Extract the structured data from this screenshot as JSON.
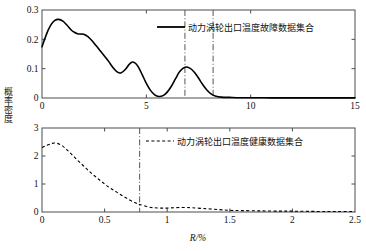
{
  "axis_label_y": "概率密度",
  "axis_label_x": "R/%",
  "colors": {
    "curve": "#000000",
    "axis": "#4d4d4d",
    "marker_line": "#555555",
    "background": "#ffffff"
  },
  "chart_data": [
    {
      "type": "line",
      "title": "",
      "xlabel": "",
      "ylabel": "概率密度",
      "xlim": [
        0,
        15
      ],
      "ylim": [
        0,
        0.3
      ],
      "xticks": [
        0,
        5,
        10,
        15
      ],
      "xticklabels": [
        "0",
        "5",
        "10",
        "15"
      ],
      "yticks": [
        0,
        0.1,
        0.2,
        0.3
      ],
      "yticklabels": [
        "0",
        "0.1",
        "0.2",
        "0.3"
      ],
      "grid": false,
      "legend_position": "top-center",
      "legend": [
        "动力涡轮出口温度故障数据集合"
      ],
      "linestyle": "solid",
      "vlines": [
        6.85,
        8.2
      ],
      "vline_style": "dashdot",
      "series": [
        {
          "name": "动力涡轮出口温度故障数据集合",
          "x": [
            0.0,
            0.15,
            0.3,
            0.45,
            0.6,
            0.8,
            1.0,
            1.2,
            1.4,
            1.55,
            1.7,
            1.85,
            2.0,
            2.2,
            2.4,
            2.6,
            2.8,
            3.0,
            3.2,
            3.4,
            3.6,
            3.8,
            4.0,
            4.15,
            4.3,
            4.45,
            4.6,
            4.8,
            5.0,
            5.2,
            5.4,
            5.6,
            5.8,
            6.0,
            6.2,
            6.4,
            6.6,
            6.85,
            7.1,
            7.3,
            7.5,
            7.7,
            7.9,
            8.1,
            8.3,
            8.6,
            9.0,
            9.5,
            10.0,
            11.0,
            12.0,
            13.0,
            14.0,
            15.0
          ],
          "y": [
            0.175,
            0.205,
            0.232,
            0.252,
            0.264,
            0.268,
            0.262,
            0.248,
            0.232,
            0.224,
            0.219,
            0.218,
            0.217,
            0.209,
            0.195,
            0.178,
            0.16,
            0.142,
            0.124,
            0.104,
            0.089,
            0.086,
            0.098,
            0.112,
            0.122,
            0.12,
            0.108,
            0.08,
            0.05,
            0.026,
            0.011,
            0.005,
            0.008,
            0.02,
            0.04,
            0.066,
            0.09,
            0.105,
            0.101,
            0.088,
            0.068,
            0.046,
            0.027,
            0.014,
            0.007,
            0.003,
            0.002,
            0.001,
            0.001,
            0.0005,
            0.0005,
            0.0005,
            0.0005,
            0.0005
          ]
        }
      ]
    },
    {
      "type": "line",
      "title": "",
      "xlabel": "R/%",
      "ylabel": "概率密度",
      "xlim": [
        0,
        2.5
      ],
      "ylim": [
        0,
        3
      ],
      "xticks": [
        0,
        0.5,
        1,
        1.5,
        2,
        2.5
      ],
      "xticklabels": [
        "0",
        "0.5",
        "1",
        "1.5",
        "2",
        "2.5"
      ],
      "yticks": [
        0,
        1,
        2,
        3
      ],
      "yticklabels": [
        "0",
        "1",
        "2",
        "3"
      ],
      "grid": false,
      "legend_position": "top-center",
      "legend": [
        "动力涡轮出口温度健康数据集合"
      ],
      "linestyle": "dashed",
      "vlines": [
        0.78
      ],
      "vline_style": "dashdot",
      "series": [
        {
          "name": "动力涡轮出口温度健康数据集合",
          "x": [
            0.0,
            0.04,
            0.08,
            0.11,
            0.15,
            0.2,
            0.25,
            0.3,
            0.35,
            0.4,
            0.45,
            0.5,
            0.55,
            0.6,
            0.65,
            0.7,
            0.75,
            0.78,
            0.85,
            0.9,
            0.95,
            1.0,
            1.05,
            1.1,
            1.15,
            1.2,
            1.3,
            1.4,
            1.5,
            1.6,
            1.75,
            1.9,
            2.0,
            2.2,
            2.35,
            2.5
          ],
          "y": [
            2.3,
            2.38,
            2.45,
            2.46,
            2.4,
            2.22,
            2.0,
            1.78,
            1.57,
            1.36,
            1.18,
            1.0,
            0.84,
            0.7,
            0.56,
            0.43,
            0.32,
            0.27,
            0.18,
            0.15,
            0.14,
            0.14,
            0.15,
            0.16,
            0.16,
            0.15,
            0.12,
            0.09,
            0.06,
            0.05,
            0.04,
            0.03,
            0.03,
            0.02,
            0.02,
            0.02
          ]
        }
      ]
    }
  ]
}
